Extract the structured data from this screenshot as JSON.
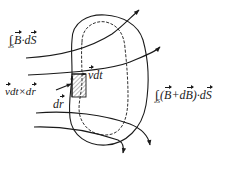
{
  "diagram": {
    "colors": {
      "stroke": "#1a1a1a",
      "background": "#ffffff",
      "hatch": "#555555"
    },
    "labels": {
      "flux_initial": {
        "integral": "∫",
        "subscript": "S",
        "vec1": "B",
        "dot": "·",
        "d": "d",
        "vec2": "S"
      },
      "flux_final": {
        "integral": "∫",
        "subscript": "S",
        "open": "(",
        "vec1": "B",
        "plus": "+d",
        "vec2": "B",
        "close": ")·d",
        "vec3": "S"
      },
      "velocity_disp": {
        "vec": "v",
        "rest": "dt"
      },
      "cross_product": {
        "vec1": "v",
        "mid": "dt×d",
        "vec2": "r"
      },
      "line_element": {
        "d": "d",
        "vec": "r"
      }
    },
    "elements": [
      "surface S (solid closed curve)",
      "displaced surface S' (dashed closed curve)",
      "magnetic field lines with arrows",
      "hatched area element vdt×dr"
    ]
  }
}
